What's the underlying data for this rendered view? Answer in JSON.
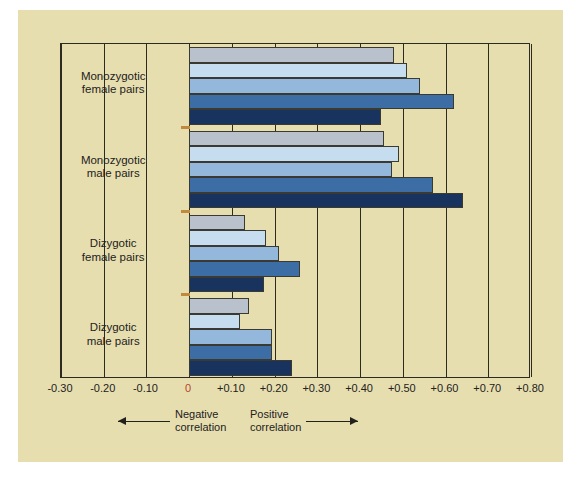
{
  "figure": {
    "background_color": "#e7deb0",
    "frame_color": "#2b2b22"
  },
  "axis": {
    "tick_labels": [
      "-0.30",
      "-0.20",
      "-0.10",
      "0",
      "+0.10",
      "+0.20",
      "+0.30",
      "+0.40",
      "+0.50",
      "+0.60",
      "+0.70",
      "+0.80"
    ],
    "zero_label_color": "#b5442b",
    "min": -0.3,
    "max": 0.8,
    "step": 0.1
  },
  "legend": {
    "negative": "Negative\ncorrelation",
    "positive": "Positive\ncorrelation",
    "negative_arrow": "arrow-left-icon",
    "positive_arrow": "arrow-right-icon"
  },
  "categories": [
    "Monozygotic\nfemale pairs",
    "Monozygotic\nmale pairs",
    "Dizygotic\nfemale pairs",
    "Dizygotic\nmale pairs"
  ],
  "series_colors": [
    "#b9c2cc",
    "#c6dcef",
    "#93b8dc",
    "#3c6ea5",
    "#17335e"
  ],
  "chart_data": {
    "type": "bar",
    "orientation": "horizontal",
    "title": "",
    "subtitle": "",
    "xlabel": "",
    "ylabel": "",
    "xlim": [
      -0.3,
      0.8
    ],
    "grid": true,
    "legend_position": "below-axis",
    "categories": [
      "Monozygotic female pairs",
      "Monozygotic male pairs",
      "Dizygotic female pairs",
      "Dizygotic male pairs"
    ],
    "series": [
      {
        "name": "study-1",
        "color": "#b9c2cc",
        "values": [
          0.48,
          0.455,
          0.13,
          0.14
        ]
      },
      {
        "name": "study-2",
        "color": "#c6dcef",
        "values": [
          0.51,
          0.49,
          0.18,
          0.12
        ]
      },
      {
        "name": "study-3",
        "color": "#93b8dc",
        "values": [
          0.54,
          0.475,
          0.21,
          0.195
        ]
      },
      {
        "name": "study-4",
        "color": "#3c6ea5",
        "values": [
          0.62,
          0.57,
          0.26,
          0.195
        ]
      },
      {
        "name": "study-5",
        "color": "#17335e",
        "values": [
          0.45,
          0.64,
          0.175,
          0.24
        ]
      }
    ],
    "axis_ticks": [
      -0.3,
      -0.2,
      -0.1,
      0,
      0.1,
      0.2,
      0.3,
      0.4,
      0.5,
      0.6,
      0.7,
      0.8
    ],
    "annotations": [
      "Negative correlation",
      "Positive correlation"
    ]
  }
}
